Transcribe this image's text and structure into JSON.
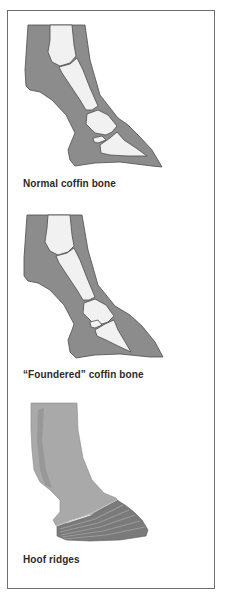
{
  "figure": {
    "panels": [
      {
        "id": "normal",
        "caption": "Normal coffin bone",
        "illustration": "hoof-cross-section-normal"
      },
      {
        "id": "foundered",
        "caption": "“Foundered” coffin bone",
        "illustration": "hoof-cross-section-foundered"
      },
      {
        "id": "ridges",
        "caption": "Hoof ridges",
        "illustration": "hoof-exterior-ridges"
      }
    ],
    "colors": {
      "tissue": "#8c8c8c",
      "bone": "#f1f1f1",
      "outline": "#4d4d4d",
      "leg_exterior": "#a9a9a9",
      "hoof_wall": "#7a7a7a",
      "border": "#6e6e6e"
    }
  }
}
